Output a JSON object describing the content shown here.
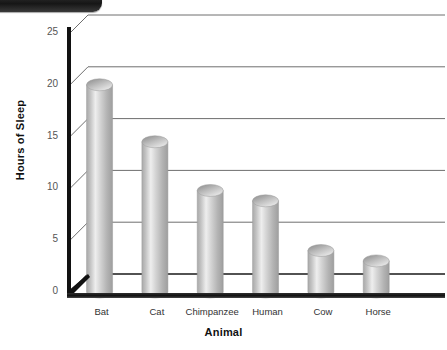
{
  "page": {
    "background": "#ffffff",
    "corner_tab": "dark-rounded-tab"
  },
  "chart_data": {
    "type": "bar",
    "title": "",
    "subtitle": "",
    "xlabel": "Animal",
    "ylabel": "Hours of Sleep",
    "categories": [
      "Bat",
      "Cat",
      "Chimpanzee",
      "Human",
      "Cow",
      "Horse"
    ],
    "values": [
      20,
      14.5,
      9.8,
      8.8,
      4,
      3
    ],
    "ylim": [
      0,
      25
    ],
    "yticks": [
      0,
      5,
      10,
      15,
      20,
      25
    ],
    "ytick_labels": [
      "0",
      "5",
      "10",
      "15",
      "20",
      "25"
    ],
    "grid": true,
    "grid_axis": "y",
    "legend": null,
    "legend_position": "none",
    "style": "3d-cylinder",
    "bar_color": "#bcbcbc",
    "bar_highlight": "#f2f2f2",
    "bar_shadow": "#8f8f8f",
    "axis_color": "#111111",
    "grid_color": "#6e6e6e"
  }
}
